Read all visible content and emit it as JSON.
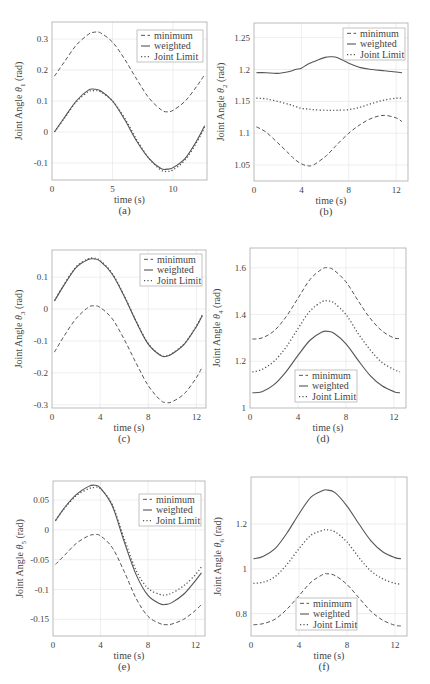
{
  "figure": {
    "panels": [
      "a",
      "b",
      "c",
      "d",
      "e",
      "f"
    ]
  },
  "legend_labels": [
    "minimum",
    "weighted",
    "Joint Limit"
  ],
  "chart_data": [
    {
      "id": "a",
      "type": "line",
      "caption": "(a)",
      "xlabel": "time (s)",
      "ylabel": "Joint Angle  θ₁  (rad)",
      "ylabel_main": "Joint Angle",
      "ylabel_sym": "θ",
      "ylabel_sub": "1",
      "ylabel_unit": "(rad)",
      "frame": [
        52,
        22,
        207,
        180
      ],
      "xlim": [
        0,
        12.8
      ],
      "ylim": [
        -0.155,
        0.355
      ],
      "xticks": [
        0,
        5,
        10
      ],
      "yticks": [
        -0.1,
        0,
        0.1,
        0.2,
        0.3
      ],
      "ytick_labels": [
        "-0.1",
        "0",
        "0.1",
        "0.2",
        "0.3"
      ],
      "grid": true,
      "legend_position": "upper right",
      "legend_box": [
        137,
        30,
        203,
        62
      ],
      "x": [
        0.2,
        1,
        2,
        3,
        3.5,
        4,
        5,
        6,
        7,
        8,
        9,
        9.5,
        10,
        11,
        12,
        12.6
      ],
      "series": [
        {
          "name": "minimum",
          "style": "dashed",
          "values": [
            0.18,
            0.225,
            0.28,
            0.315,
            0.322,
            0.32,
            0.29,
            0.235,
            0.17,
            0.11,
            0.072,
            0.065,
            0.07,
            0.1,
            0.15,
            0.185
          ]
        },
        {
          "name": "weighted",
          "style": "solid",
          "values": [
            0.0,
            0.045,
            0.1,
            0.135,
            0.138,
            0.133,
            0.1,
            0.04,
            -0.03,
            -0.085,
            -0.118,
            -0.12,
            -0.115,
            -0.085,
            -0.025,
            0.02
          ]
        },
        {
          "name": "Joint Limit",
          "style": "dotted",
          "values": [
            0.0,
            0.043,
            0.097,
            0.13,
            0.133,
            0.13,
            0.1,
            0.045,
            -0.025,
            -0.085,
            -0.123,
            -0.127,
            -0.122,
            -0.09,
            -0.03,
            0.015
          ]
        }
      ]
    },
    {
      "id": "b",
      "type": "line",
      "caption": "(b)",
      "xlabel": "time (s)",
      "ylabel": "Joint Angle  θ₂  (rad)",
      "ylabel_main": "Joint Angle",
      "ylabel_sym": "θ",
      "ylabel_sub": "2",
      "ylabel_unit": "(rad)",
      "frame": [
        254,
        23,
        408,
        181
      ],
      "xlim": [
        0,
        13
      ],
      "ylim": [
        1.025,
        1.273
      ],
      "xticks": [
        0,
        4,
        8,
        12
      ],
      "yticks": [
        1.05,
        1.1,
        1.15,
        1.2,
        1.25
      ],
      "ytick_labels": [
        "1.05",
        "1.1",
        "1.15",
        "1.2",
        "1.25"
      ],
      "grid": true,
      "legend_position": "upper right",
      "legend_box": [
        343,
        28,
        405,
        60
      ],
      "x": [
        0.2,
        1,
        2,
        3,
        3.5,
        4,
        4.5,
        5,
        6,
        6.5,
        7,
        8,
        9,
        10,
        11,
        12,
        12.5
      ],
      "series": [
        {
          "name": "minimum",
          "style": "dashed",
          "values": [
            1.11,
            1.102,
            1.085,
            1.067,
            1.058,
            1.052,
            1.049,
            1.05,
            1.063,
            1.072,
            1.082,
            1.1,
            1.114,
            1.124,
            1.128,
            1.124,
            1.118
          ]
        },
        {
          "name": "weighted",
          "style": "solid",
          "values": [
            1.195,
            1.195,
            1.194,
            1.197,
            1.2,
            1.202,
            1.208,
            1.212,
            1.219,
            1.22,
            1.219,
            1.21,
            1.203,
            1.2,
            1.198,
            1.196,
            1.195
          ]
        },
        {
          "name": "Joint Limit",
          "style": "dotted",
          "values": [
            1.155,
            1.154,
            1.15,
            1.145,
            1.142,
            1.139,
            1.138,
            1.137,
            1.136,
            1.136,
            1.136,
            1.137,
            1.141,
            1.147,
            1.152,
            1.155,
            1.155
          ]
        }
      ]
    },
    {
      "id": "c",
      "type": "line",
      "caption": "(c)",
      "xlabel": "time (s)",
      "ylabel": "Joint Angle  θ₃  (rad)",
      "ylabel_main": "Joint Angle",
      "ylabel_sym": "θ",
      "ylabel_sub": "3",
      "ylabel_unit": "(rad)",
      "frame": [
        52,
        250,
        206,
        408
      ],
      "xlim": [
        0,
        12.8
      ],
      "ylim": [
        -0.31,
        0.185
      ],
      "xticks": [
        0,
        4,
        8,
        12
      ],
      "yticks": [
        -0.3,
        -0.2,
        -0.1,
        0,
        0.1
      ],
      "ytick_labels": [
        "-0.3",
        "-0.2",
        "-0.1",
        "0",
        "0.1"
      ],
      "grid": true,
      "legend_position": "upper right",
      "legend_box": [
        140,
        254,
        202,
        286
      ],
      "x": [
        0.2,
        1,
        2,
        3,
        3.5,
        4,
        5,
        6,
        7,
        8,
        9,
        9.5,
        10,
        11,
        12,
        12.5
      ],
      "series": [
        {
          "name": "minimum",
          "style": "dashed",
          "values": [
            -0.135,
            -0.085,
            -0.03,
            0.005,
            0.01,
            0.005,
            -0.03,
            -0.095,
            -0.17,
            -0.24,
            -0.285,
            -0.293,
            -0.29,
            -0.265,
            -0.215,
            -0.18
          ]
        },
        {
          "name": "weighted",
          "style": "solid",
          "values": [
            0.025,
            0.075,
            0.13,
            0.155,
            0.157,
            0.15,
            0.11,
            0.04,
            -0.04,
            -0.11,
            -0.145,
            -0.148,
            -0.14,
            -0.11,
            -0.055,
            -0.02
          ]
        },
        {
          "name": "Joint Limit",
          "style": "dotted",
          "values": [
            0.026,
            0.077,
            0.132,
            0.157,
            0.159,
            0.152,
            0.112,
            0.042,
            -0.038,
            -0.108,
            -0.144,
            -0.147,
            -0.139,
            -0.108,
            -0.053,
            -0.018
          ]
        }
      ]
    },
    {
      "id": "d",
      "type": "line",
      "caption": "(d)",
      "xlabel": "time (s)",
      "ylabel": "Joint Angle  θ₄  (rad)",
      "ylabel_main": "Joint Angle",
      "ylabel_sym": "θ",
      "ylabel_sub": "4",
      "ylabel_unit": "(rad)",
      "frame": [
        250,
        248,
        406,
        408
      ],
      "xlim": [
        0,
        13
      ],
      "ylim": [
        1.0,
        1.685
      ],
      "xticks": [
        0,
        4,
        8,
        12
      ],
      "yticks": [
        1.0,
        1.2,
        1.4,
        1.6
      ],
      "ytick_labels": [
        "1",
        "1.2",
        "1.4",
        "1.6"
      ],
      "grid": true,
      "legend_position": "lower center",
      "legend_box": [
        295,
        370,
        357,
        402
      ],
      "x": [
        0.2,
        1,
        2,
        3,
        4,
        5,
        6,
        6.5,
        7,
        8,
        9,
        10,
        11,
        12,
        12.5
      ],
      "series": [
        {
          "name": "minimum",
          "style": "dashed",
          "values": [
            1.295,
            1.3,
            1.33,
            1.39,
            1.47,
            1.55,
            1.595,
            1.6,
            1.59,
            1.54,
            1.46,
            1.385,
            1.33,
            1.3,
            1.298
          ]
        },
        {
          "name": "weighted",
          "style": "solid",
          "values": [
            1.065,
            1.07,
            1.1,
            1.155,
            1.225,
            1.29,
            1.325,
            1.328,
            1.32,
            1.275,
            1.205,
            1.14,
            1.095,
            1.07,
            1.065
          ]
        },
        {
          "name": "Joint Limit",
          "style": "dotted",
          "values": [
            1.155,
            1.165,
            1.2,
            1.26,
            1.34,
            1.415,
            1.455,
            1.458,
            1.45,
            1.4,
            1.32,
            1.25,
            1.195,
            1.165,
            1.155
          ]
        }
      ]
    },
    {
      "id": "e",
      "type": "line",
      "caption": "(e)",
      "xlabel": "time (s)",
      "ylabel": "Joint Angle  θ₅  (rad)",
      "ylabel_main": "Joint Angle",
      "ylabel_sym": "θ",
      "ylabel_sub": "5",
      "ylabel_unit": "(rad)",
      "frame": [
        53,
        481,
        205,
        636
      ],
      "xlim": [
        0,
        12.8
      ],
      "ylim": [
        -0.178,
        0.082
      ],
      "xticks": [
        0,
        4,
        8,
        12
      ],
      "yticks": [
        -0.15,
        -0.1,
        -0.05,
        0,
        0.05
      ],
      "ytick_labels": [
        "-0.15",
        "-0.1",
        "-0.05",
        "0",
        "0.05"
      ],
      "grid": true,
      "legend_position": "upper right",
      "legend_box": [
        139,
        494,
        201,
        526
      ],
      "x": [
        0.2,
        1,
        2,
        3,
        3.5,
        4,
        5,
        6,
        7,
        8,
        9,
        9.5,
        10,
        11,
        12,
        12.5
      ],
      "series": [
        {
          "name": "minimum",
          "style": "dashed",
          "values": [
            -0.058,
            -0.042,
            -0.022,
            -0.01,
            -0.008,
            -0.01,
            -0.03,
            -0.07,
            -0.115,
            -0.145,
            -0.157,
            -0.159,
            -0.158,
            -0.15,
            -0.135,
            -0.125
          ]
        },
        {
          "name": "weighted",
          "style": "solid",
          "values": [
            0.015,
            0.038,
            0.06,
            0.073,
            0.075,
            0.07,
            0.04,
            -0.02,
            -0.075,
            -0.11,
            -0.124,
            -0.125,
            -0.122,
            -0.108,
            -0.085,
            -0.072
          ]
        },
        {
          "name": "Joint Limit",
          "style": "dotted",
          "values": [
            0.016,
            0.037,
            0.058,
            0.069,
            0.071,
            0.069,
            0.042,
            -0.015,
            -0.068,
            -0.098,
            -0.108,
            -0.109,
            -0.106,
            -0.094,
            -0.075,
            -0.062
          ]
        }
      ]
    },
    {
      "id": "f",
      "type": "line",
      "caption": "(f)",
      "xlabel": "time (s)",
      "ylabel": "Joint Angle  θ₆  (rad)",
      "ylabel_main": "Joint Angle",
      "ylabel_sym": "θ",
      "ylabel_sub": "6",
      "ylabel_unit": "(rad)",
      "frame": [
        251,
        477,
        407,
        636
      ],
      "xlim": [
        0,
        13
      ],
      "ylim": [
        0.7,
        1.41
      ],
      "xticks": [
        0,
        4,
        8,
        12
      ],
      "yticks": [
        0.8,
        1.0,
        1.2
      ],
      "ytick_labels": [
        "0.8",
        "1",
        "1.2"
      ],
      "grid": true,
      "legend_position": "lower center",
      "legend_box": [
        296,
        598,
        357,
        630
      ],
      "x": [
        0.2,
        1,
        2,
        3,
        4,
        5,
        6,
        6.3,
        7,
        8,
        9,
        10,
        11,
        12,
        12.5
      ],
      "series": [
        {
          "name": "minimum",
          "style": "dashed",
          "values": [
            0.75,
            0.755,
            0.775,
            0.82,
            0.88,
            0.94,
            0.975,
            0.978,
            0.97,
            0.93,
            0.87,
            0.81,
            0.77,
            0.748,
            0.745
          ]
        },
        {
          "name": "weighted",
          "style": "solid",
          "values": [
            1.045,
            1.055,
            1.09,
            1.16,
            1.245,
            1.32,
            1.35,
            1.352,
            1.34,
            1.28,
            1.2,
            1.125,
            1.075,
            1.05,
            1.045
          ]
        },
        {
          "name": "Joint Limit",
          "style": "dotted",
          "values": [
            0.935,
            0.94,
            0.965,
            1.02,
            1.09,
            1.15,
            1.172,
            1.174,
            1.165,
            1.12,
            1.05,
            0.99,
            0.955,
            0.935,
            0.932
          ]
        }
      ]
    }
  ]
}
